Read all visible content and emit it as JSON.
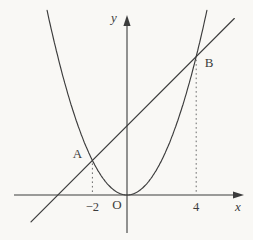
{
  "figure": {
    "background": "#f9f8f5"
  },
  "chart_data": {
    "type": "line",
    "title": "",
    "xlabel": "x",
    "ylabel": "y",
    "origin_label": "O",
    "grid": false,
    "legend": false,
    "stroke_color": "#3c3c3c",
    "dotted_color": "#6a6a6a",
    "series": [
      {
        "name": "parabola",
        "equation": "y = x^2/2",
        "coefficient_a": 0.5,
        "x_range": [
          -4.62,
          4.65
        ]
      },
      {
        "name": "secant-line",
        "equation": "y = x + 4",
        "slope": 1,
        "intercept": 4,
        "x_range": [
          -5.55,
          6.2
        ]
      }
    ],
    "points": [
      {
        "label": "A",
        "x": -2,
        "y": 2
      },
      {
        "label": "B",
        "x": 4,
        "y": 8
      }
    ],
    "x_ticks": [
      {
        "value": -2,
        "label": "−2"
      },
      {
        "value": 4,
        "label": "4"
      }
    ],
    "axis_ranges": {
      "x": [
        -6.5,
        6.6
      ],
      "y": [
        -2.2,
        10.4
      ]
    }
  }
}
